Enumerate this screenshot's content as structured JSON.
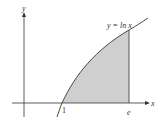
{
  "diagram": {
    "curve_label": "y = ln x",
    "x_axis_label": "x",
    "y_axis_label": "y",
    "x_tick_1": "1",
    "x_tick_e": "e",
    "colors": {
      "axes": "#333333",
      "curve": "#333333",
      "shade": "#cfcfcf"
    }
  }
}
